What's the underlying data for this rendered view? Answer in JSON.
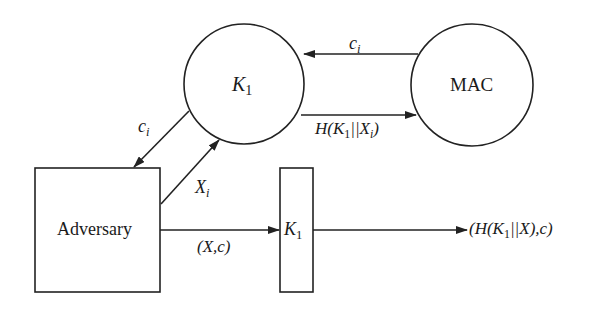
{
  "nodes": {
    "k1_circle": {
      "label_main": "K",
      "label_sub": "1"
    },
    "mac_circle": {
      "label": "MAC"
    },
    "adversary_box": {
      "label": "Adversary"
    },
    "k1_box": {
      "label_main": "K",
      "label_sub": "1"
    }
  },
  "edges": {
    "mac_to_k1": {
      "label_main": "c",
      "label_sub": "i"
    },
    "k1_to_mac": {
      "prefix": "H(K",
      "sub1": "1",
      "middle": "||X",
      "sub2": "i",
      "suffix": ")"
    },
    "k1_to_adversary": {
      "label_main": "c",
      "label_sub": "i"
    },
    "adversary_to_k1": {
      "label_main": "X",
      "label_sub": "i"
    },
    "adversary_to_k1box": {
      "label": "(X,c)"
    },
    "k1box_to_output": {
      "prefix": "(H(K",
      "sub1": "1",
      "suffix": "||X),c)"
    }
  },
  "colors": {
    "stroke": "#222222",
    "background": "#ffffff"
  }
}
